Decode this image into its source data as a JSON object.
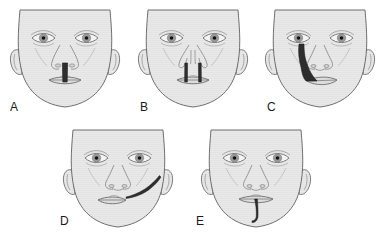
{
  "figure": {
    "background_color": "#ffffff",
    "width": 386,
    "height": 239,
    "skin_fill": "#e9e9e9",
    "outline_color": "#6f6f6f",
    "cleft_color": "#2e2e2e",
    "iris_color": "#9a9a9a",
    "pupil_color": "#121212",
    "sclera_color": "#f4f4f4"
  },
  "panels": [
    {
      "label": "A",
      "name": "median-cleft-lip",
      "description": "Infant face with a median cleft of the upper lip extending from the nasal base to the lip",
      "row": 1,
      "column": 1,
      "center_x": 65,
      "center_y": 58
    },
    {
      "label": "B",
      "name": "bilateral-cleft-lip",
      "description": "Infant face with bilateral clefts of the upper lip forming two vertical gaps",
      "row": 1,
      "column": 2,
      "center_x": 193,
      "center_y": 58
    },
    {
      "label": "C",
      "name": "oblique-facial-cleft",
      "description": "Infant face with an oblique facial cleft running from the lower eyelid to the upper lip",
      "row": 1,
      "column": 3,
      "center_x": 320,
      "center_y": 58
    },
    {
      "label": "D",
      "name": "transverse-facial-cleft",
      "description": "Infant face with a transverse facial cleft (macrostomia) extending from the oral commissure toward the ear",
      "row": 2,
      "column": 1,
      "center_x": 118,
      "center_y": 178
    },
    {
      "label": "E",
      "name": "median-mandibular-cleft",
      "description": "Infant face with a median mandibular cleft extending downward from the lower lip",
      "row": 2,
      "column": 2,
      "center_x": 256,
      "center_y": 178
    }
  ]
}
